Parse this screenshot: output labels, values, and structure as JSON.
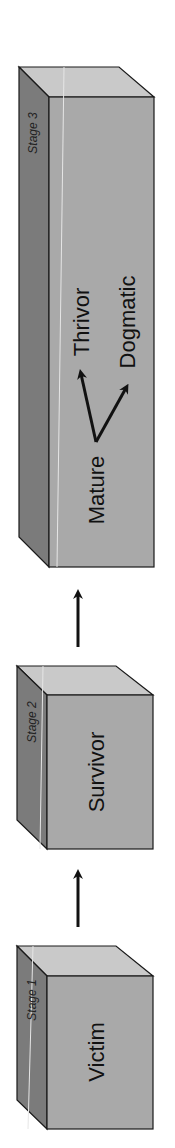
{
  "diagram": {
    "colors": {
      "front": "#a9a9a9",
      "top": "#c9c9c9",
      "side": "#7b7b7b",
      "edge": "#1a1a1a",
      "arrow": "#111111",
      "highlight": "#e6e6e6"
    },
    "stages": [
      {
        "id": "stage3",
        "stage_label": "Stage 3",
        "outcomes_from": "Mature",
        "outcomes": [
          "Thrivor",
          "Dogmatic"
        ]
      },
      {
        "id": "stage2",
        "stage_label": "Stage 2",
        "title": "Survivor"
      },
      {
        "id": "stage1",
        "stage_label": "Stage 1",
        "title": "Victim"
      }
    ],
    "stage3": {
      "stage_label": "Stage 3",
      "start_label": "Mature",
      "outcome_a": "Thrivor",
      "outcome_b": "Dogmatic"
    },
    "stage2": {
      "stage_label": "Stage 2",
      "title": "Survivor"
    },
    "stage1": {
      "stage_label": "Stage 1",
      "title": "Victim"
    },
    "transitions": [
      {
        "from": "Victim",
        "to": "Survivor"
      },
      {
        "from": "Survivor",
        "to": "Mature"
      },
      {
        "from": "Mature",
        "to": "Thrivor"
      },
      {
        "from": "Mature",
        "to": "Dogmatic"
      }
    ]
  }
}
